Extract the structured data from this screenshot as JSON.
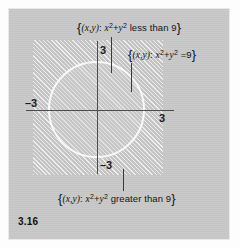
{
  "figure": {
    "number": "3.16",
    "caption_number_label": "3.16"
  },
  "chart_data": {
    "type": "scatter",
    "title": "",
    "xlabel": "",
    "ylabel": "",
    "grid": false,
    "legend_position": "callouts",
    "xlim": [
      -4.3,
      4.3
    ],
    "ylim": [
      -4.3,
      4.3
    ],
    "circle": {
      "equation": "x^2 + y^2 = 9",
      "center": [
        0,
        0
      ],
      "radius": 3
    },
    "regions": [
      {
        "name": "interior",
        "condition": "x^2 + y^2 less than 9"
      },
      {
        "name": "boundary",
        "condition": "x^2 + y^2 = 9"
      },
      {
        "name": "exterior",
        "condition": "x^2 + y^2 greater than 9"
      }
    ],
    "tick_values": [
      -3,
      3
    ]
  },
  "axes": {
    "y_positive_tick": "3",
    "y_negative_tick": "–3",
    "x_negative_tick": "–3",
    "x_positive_tick": "3"
  },
  "labels": {
    "top": {
      "open_brace": "{",
      "tuple": "(x,y)",
      "colon": ":",
      "expr_base_x": "x",
      "expr_sup_x": "2",
      "plus": "+",
      "expr_base_y": "y",
      "expr_sup_y": "2",
      "relation": "less than 9",
      "close_brace": "}",
      "full_text": "{(x,y): x2+y2 less than 9}"
    },
    "right": {
      "open_brace": "{",
      "tuple": "(x,y)",
      "colon": ":",
      "expr_base_x": "x",
      "expr_sup_x": "2",
      "plus": "+",
      "expr_base_y": "y",
      "expr_sup_y": "2",
      "relation": "=9",
      "close_brace": "}",
      "full_text": "{(x,y): x2+y2 =9}"
    },
    "bottom": {
      "open_brace": "{",
      "tuple": "(x,y)",
      "colon": ":",
      "expr_base_x": "x",
      "expr_sup_x": "2",
      "plus": "+",
      "expr_base_y": "y",
      "expr_sup_y": "2",
      "relation": "greater than 9",
      "close_brace": "}",
      "full_text": "{(x,y): x2+y2 greater than 9}"
    }
  },
  "colors": {
    "panel_background": "#c8c8c8",
    "hatch_region": "#c4c4c4",
    "hatch_line": "#ffffff",
    "circle_stroke": "#fcfcfc",
    "axis": "#4d4d4d",
    "text": "#141414",
    "page_background": "#fdfdfd"
  }
}
